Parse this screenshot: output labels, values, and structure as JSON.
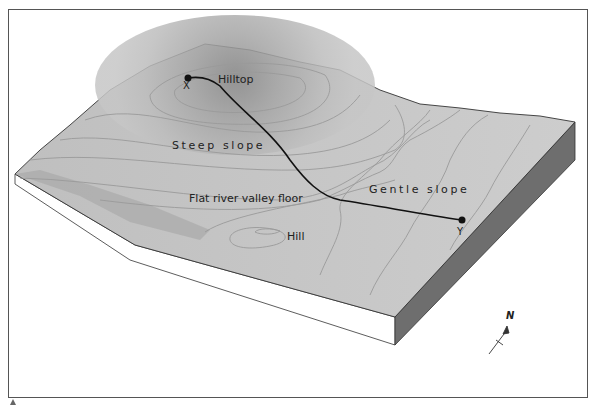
{
  "diagram": {
    "type": "block-diagram-topographic-landscape",
    "labels": {
      "hilltop": "Hilltop",
      "steep_slope": "Steep slope",
      "flat_valley": "Flat river valley floor",
      "hill": "Hill",
      "gentle_slope": "Gentle slope",
      "point_x": "X",
      "point_y": "Y",
      "north": "N"
    },
    "path": {
      "from": "X",
      "to": "Y",
      "description": "profile line from hilltop to gentle slope"
    },
    "colors": {
      "terrain_surface": "#c4c4c4",
      "hilltop_shade": "#8f8f8f",
      "block_side_dark": "#6e6e6e",
      "block_front": "#ffffff",
      "contour_line": "#9a9a9a",
      "profile_line": "#111111",
      "frame": "#555555"
    }
  }
}
